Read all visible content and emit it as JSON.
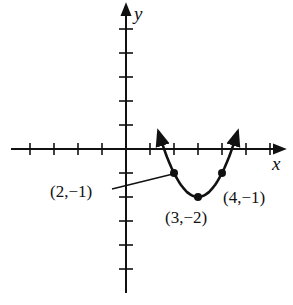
{
  "chart_data": {
    "type": "line",
    "title": "",
    "xlabel": "x",
    "ylabel": "y",
    "function": "y = (x - 3)^2 - 2",
    "xlim": [
      -5,
      7
    ],
    "ylim": [
      -5,
      6
    ],
    "x_ticks": [
      -4,
      -3,
      -2,
      -1,
      1,
      2,
      3,
      4,
      5,
      6
    ],
    "y_ticks": [
      5,
      4,
      3,
      2,
      1,
      -1,
      -2,
      -3,
      -4,
      -5
    ],
    "tick_labels_shown": false,
    "grid": false,
    "curve_arrows_both_ends": true,
    "points": [
      {
        "x": 2,
        "y": -1,
        "label": "(2,−1)"
      },
      {
        "x": 3,
        "y": -2,
        "label": "(3,−2)"
      },
      {
        "x": 4,
        "y": -1,
        "label": "(4,−1)"
      }
    ],
    "color": "#111111"
  },
  "labels": {
    "x_axis": "x",
    "y_axis": "y",
    "p1": "(2,−1)",
    "p2": "(3,−2)",
    "p3": "(4,−1)"
  }
}
